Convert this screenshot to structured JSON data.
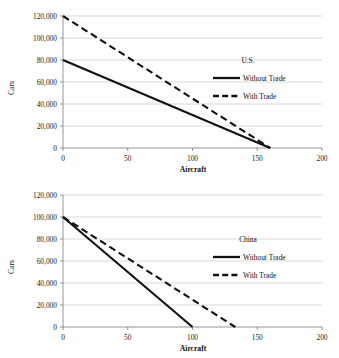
{
  "page": {
    "background": "#ffffff",
    "line_color": "#111111",
    "grid_color": "#c9c9c9",
    "axis_color": "#7a7a7a"
  },
  "chart_data": [
    {
      "type": "line",
      "title": "U.S.",
      "panel": "top",
      "xlabel": "Aircraft",
      "ylabel": "Cars",
      "xlim": [
        0,
        200
      ],
      "ylim": [
        0,
        120000
      ],
      "xticks": [
        0,
        50,
        100,
        150,
        200
      ],
      "xticklabels": [
        "0",
        "50",
        "100",
        "150",
        "200"
      ],
      "yticks": [
        0,
        20000,
        40000,
        60000,
        80000,
        100000,
        120000
      ],
      "yticklabels": [
        "0",
        "20,000",
        "40,000",
        "60,000",
        "80,000",
        "100,000",
        "120,000"
      ],
      "grid": "horizontal",
      "legend_position": "inside-right",
      "legend_title": "U.S.",
      "series": [
        {
          "name": "Without Trade",
          "style": "solid",
          "color": "#111111",
          "x": [
            0,
            160
          ],
          "y": [
            80000,
            0
          ]
        },
        {
          "name": "With Trade",
          "style": "dashed",
          "color": "#111111",
          "x": [
            0,
            160
          ],
          "y": [
            120000,
            0
          ]
        }
      ]
    },
    {
      "type": "line",
      "title": "China",
      "panel": "bottom",
      "xlabel": "Aircraft",
      "ylabel": "Cars",
      "xlim": [
        0,
        200
      ],
      "ylim": [
        0,
        120000
      ],
      "xticks": [
        0,
        50,
        100,
        150,
        200
      ],
      "xticklabels": [
        "0",
        "50",
        "100",
        "150",
        "200"
      ],
      "yticks": [
        0,
        20000,
        40000,
        60000,
        80000,
        100000,
        120000
      ],
      "yticklabels": [
        "0",
        "20,000",
        "40,000",
        "60,000",
        "80,000",
        "100,000",
        "120,000"
      ],
      "grid": "horizontal",
      "legend_position": "inside-right",
      "legend_title": "China",
      "series": [
        {
          "name": "Without Trade",
          "style": "solid",
          "color": "#111111",
          "x": [
            0,
            100
          ],
          "y": [
            100000,
            0
          ]
        },
        {
          "name": "With Trade",
          "style": "dashed",
          "color": "#111111",
          "x": [
            0,
            133
          ],
          "y": [
            100000,
            0
          ]
        }
      ]
    }
  ]
}
